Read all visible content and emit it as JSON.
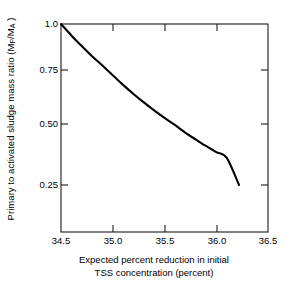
{
  "chart_data": {
    "type": "line",
    "title": "",
    "xlabel": "Expected percent reduction in initial TSS concentration (percent)",
    "xlabel_line1": "Expected percent reduction in initial",
    "xlabel_line2": "TSS concentration (percent)",
    "ylabel": "Primary to activated sludge mass ratio (MP/MA)",
    "ylabel_prefix": "Primary to activated sludge mass ratio (M",
    "ylabel_sub1": "P",
    "ylabel_mid": "/M",
    "ylabel_sub2": "A",
    "ylabel_suffix": " )",
    "xlim": [
      34.5,
      36.5
    ],
    "ylim": [
      0.25,
      1.0
    ],
    "xticks": [
      34.5,
      35.0,
      35.5,
      36.0,
      36.5
    ],
    "xticklabels": [
      "34.5",
      "35.0",
      "35.5",
      "36.0",
      "36.5"
    ],
    "yticks": [
      1.0,
      0.75,
      0.5,
      0.25
    ],
    "yticklabels": [
      "1.0",
      "0.75",
      "0.50",
      "0.25"
    ],
    "yscale": "nonlinear",
    "grid": false,
    "legend": false,
    "line_color": "#000000",
    "frame_color": "#1a1a1a",
    "background": "#ffffff",
    "series": [
      {
        "name": "Primary to activated sludge mass ratio",
        "x": [
          34.5,
          34.6,
          34.7,
          34.8,
          34.9,
          35.0,
          35.1,
          35.2,
          35.3,
          35.4,
          35.5,
          35.6,
          35.7,
          35.8,
          35.9,
          36.0,
          36.1,
          36.22
        ],
        "y": [
          1.0,
          0.938,
          0.88,
          0.825,
          0.774,
          0.726,
          0.681,
          0.639,
          0.6,
          0.563,
          0.528,
          0.496,
          0.465,
          0.437,
          0.41,
          0.385,
          0.362,
          0.25
        ]
      }
    ],
    "annotations": []
  },
  "figure": {
    "plot_area": {
      "left": 61,
      "right": 268,
      "top": 24,
      "bottom": 232
    },
    "ytick_pixels": [
      24,
      70,
      124,
      185
    ],
    "xtick_pixels": [
      61,
      113,
      165,
      217,
      268
    ]
  }
}
